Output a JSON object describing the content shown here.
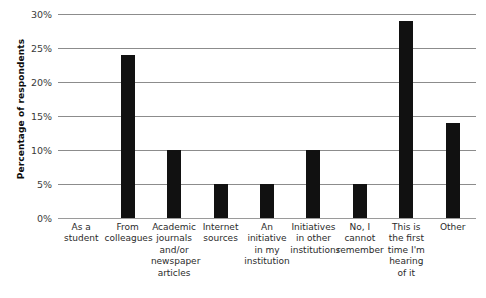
{
  "chart_data": {
    "type": "bar",
    "title": "",
    "xlabel": "",
    "ylabel": "Percentage of respondents",
    "ylim": [
      0,
      30
    ],
    "ytick_labels": [
      "0%",
      "5%",
      "10%",
      "15%",
      "20%",
      "25%",
      "30%"
    ],
    "ytick_values": [
      0,
      5,
      10,
      15,
      20,
      25,
      30
    ],
    "grid": true,
    "legend": "none",
    "orientation": "vertical",
    "bar_color": "#111111",
    "gridline_color": "#8c8c8c",
    "categories": [
      "As a student",
      "From colleagues",
      "Academic journals and/or newspaper articles",
      "Internet sources",
      "An initiative in my institution",
      "Initiatives in other institutions",
      "No, I cannot remember",
      "This is the first time I'm hearing of it",
      "Other"
    ],
    "category_lines": [
      [
        "As a",
        "student"
      ],
      [
        "From",
        "colleagues"
      ],
      [
        "Academic",
        "journals",
        "and/or",
        "newspaper",
        "articles"
      ],
      [
        "Internet",
        "sources"
      ],
      [
        "An",
        "initiative",
        "in my",
        "institution"
      ],
      [
        "Initiatives",
        "in other",
        "institutions"
      ],
      [
        "No, I",
        "cannot",
        "remember"
      ],
      [
        "This is",
        "the first",
        "time I'm",
        "hearing",
        "of it"
      ],
      [
        "Other"
      ]
    ],
    "values": [
      0,
      24,
      10,
      5,
      5,
      10,
      5,
      29,
      14
    ]
  }
}
